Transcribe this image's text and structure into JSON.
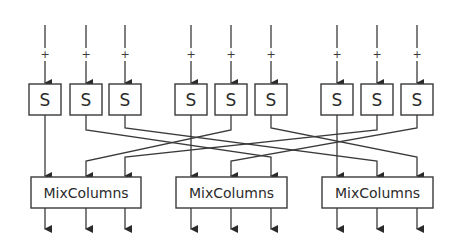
{
  "diagram": {
    "type": "block-diagram",
    "inputs": [
      {
        "x": 45,
        "marker": "+"
      },
      {
        "x": 86,
        "marker": "+"
      },
      {
        "x": 125,
        "marker": "+"
      },
      {
        "x": 191,
        "marker": "+"
      },
      {
        "x": 231,
        "marker": "+"
      },
      {
        "x": 271,
        "marker": "+"
      },
      {
        "x": 337,
        "marker": "+"
      },
      {
        "x": 377,
        "marker": "+"
      },
      {
        "x": 417,
        "marker": "+"
      }
    ],
    "sboxes": [
      {
        "label": "S",
        "x": 45
      },
      {
        "label": "S",
        "x": 86
      },
      {
        "label": "S",
        "x": 125
      },
      {
        "label": "S",
        "x": 191
      },
      {
        "label": "S",
        "x": 231
      },
      {
        "label": "S",
        "x": 271
      },
      {
        "label": "S",
        "x": 337
      },
      {
        "label": "S",
        "x": 377
      },
      {
        "label": "S",
        "x": 417
      }
    ],
    "mixcolumns": [
      {
        "label": "MixColumns",
        "x1": 31,
        "x2": 141
      },
      {
        "label": "MixColumns",
        "x1": 176,
        "x2": 287
      },
      {
        "label": "MixColumns",
        "x1": 322,
        "x2": 433
      }
    ],
    "connections": [
      {
        "from": "S1.1",
        "to": "Mix1.1"
      },
      {
        "from": "S1.2",
        "to": "Mix2.3"
      },
      {
        "from": "S1.3",
        "to": "Mix3.2"
      },
      {
        "from": "S2.1",
        "to": "Mix2.1"
      },
      {
        "from": "S2.2",
        "to": "Mix1.2"
      },
      {
        "from": "S2.3",
        "to": "Mix3.3"
      },
      {
        "from": "S3.1",
        "to": "Mix3.1"
      },
      {
        "from": "S3.2",
        "to": "Mix1.3"
      },
      {
        "from": "S3.3",
        "to": "Mix2.2"
      }
    ]
  }
}
